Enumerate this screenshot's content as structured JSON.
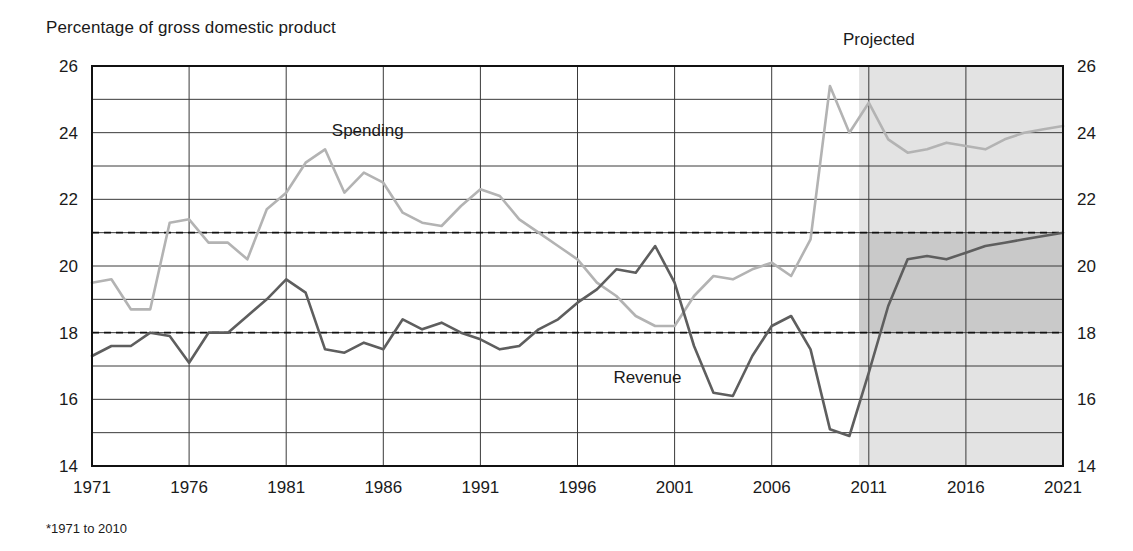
{
  "figure": {
    "axis_title": "Percentage of gross domestic product",
    "projected_label": "Projected",
    "footnote": "*1971 to 2010"
  },
  "chart_data": {
    "type": "line",
    "title": "Percentage of gross domestic product",
    "xlabel": "",
    "ylabel": "Percentage of gross domestic product",
    "xlim": [
      1971,
      2021
    ],
    "ylim": [
      14,
      26
    ],
    "xticks": [
      1971,
      1976,
      1981,
      1986,
      1991,
      1996,
      2001,
      2006,
      2011,
      2016,
      2021
    ],
    "yticks": [
      14,
      16,
      18,
      20,
      22,
      24,
      26
    ],
    "gridlines_y": [
      15,
      16,
      17,
      18,
      19,
      20,
      21,
      22,
      23,
      24,
      25
    ],
    "grid": true,
    "legend_position": "inline-labels",
    "annotations": [
      {
        "text": "Spending",
        "x": 1985.2,
        "y": 23.9
      },
      {
        "text": "Revenue",
        "x": 1999.6,
        "y": 16.5
      },
      {
        "text": "Projected",
        "x": 2012.0,
        "y": 26.6
      }
    ],
    "shaded_regions": [
      {
        "name": "projected-area",
        "x_start": 2010.5,
        "x_end": 2021,
        "color": "#e3e3e3"
      },
      {
        "name": "projected-gap-band",
        "x_start": 2010.5,
        "x_end": 2021,
        "y_start": 18.0,
        "y_end": 21.0,
        "color": "#c9c9c9"
      }
    ],
    "reference_lines": [
      {
        "name": "average-spending",
        "value": 21.0,
        "style": "dashed",
        "note": "*1971 to 2010"
      },
      {
        "name": "average-revenue",
        "value": 18.0,
        "style": "dashed",
        "note": "*1971 to 2010"
      }
    ],
    "x": [
      1971,
      1972,
      1973,
      1974,
      1975,
      1976,
      1977,
      1978,
      1979,
      1980,
      1981,
      1982,
      1983,
      1984,
      1985,
      1986,
      1987,
      1988,
      1989,
      1990,
      1991,
      1992,
      1993,
      1994,
      1995,
      1996,
      1997,
      1998,
      1999,
      2000,
      2001,
      2002,
      2003,
      2004,
      2005,
      2006,
      2007,
      2008,
      2009,
      2010,
      2011,
      2012,
      2013,
      2014,
      2015,
      2016,
      2017,
      2018,
      2019,
      2020,
      2021
    ],
    "series": [
      {
        "name": "Spending",
        "color": "#b3b3b3",
        "values": [
          19.5,
          19.6,
          18.7,
          18.7,
          21.3,
          21.4,
          20.7,
          20.7,
          20.2,
          21.7,
          22.2,
          23.1,
          23.5,
          22.2,
          22.8,
          22.5,
          21.6,
          21.3,
          21.2,
          21.8,
          22.3,
          22.1,
          21.4,
          21.0,
          20.6,
          20.2,
          19.5,
          19.1,
          18.5,
          18.2,
          18.2,
          19.1,
          19.7,
          19.6,
          19.9,
          20.1,
          19.7,
          20.8,
          25.4,
          24.0,
          24.9,
          23.8,
          23.4,
          23.5,
          23.7,
          23.6,
          23.5,
          23.8,
          24.0,
          24.1,
          24.2
        ]
      },
      {
        "name": "Revenue",
        "color": "#5e5e5e",
        "values": [
          17.3,
          17.6,
          17.6,
          18.0,
          17.9,
          17.1,
          18.0,
          18.0,
          18.5,
          19.0,
          19.6,
          19.2,
          17.5,
          17.4,
          17.7,
          17.5,
          18.4,
          18.1,
          18.3,
          18.0,
          17.8,
          17.5,
          17.6,
          18.1,
          18.4,
          18.9,
          19.3,
          19.9,
          19.8,
          20.6,
          19.5,
          17.6,
          16.2,
          16.1,
          17.3,
          18.2,
          18.5,
          17.5,
          15.1,
          14.9,
          16.8,
          18.8,
          20.2,
          20.3,
          20.2,
          20.4,
          20.6,
          20.7,
          20.8,
          20.9,
          21.0
        ]
      }
    ]
  }
}
